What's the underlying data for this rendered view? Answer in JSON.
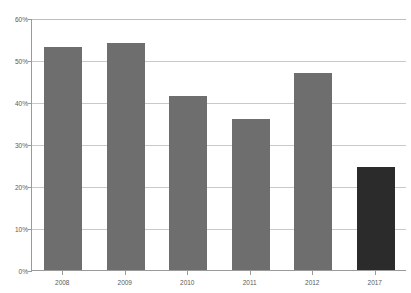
{
  "chart_data": {
    "type": "bar",
    "title": "",
    "xlabel": "",
    "ylabel": "",
    "categories": [
      "2008",
      "2009",
      "2010",
      "2011",
      "2012",
      "2017"
    ],
    "values": [
      53,
      54,
      41.5,
      36,
      47,
      24.5
    ],
    "ylim": [
      0,
      60
    ],
    "ytick_labels": [
      "0%",
      "10%",
      "20%",
      "30%",
      "40%",
      "50%",
      "60%"
    ],
    "ytick_values": [
      0,
      10,
      20,
      30,
      40,
      50,
      60
    ],
    "grid": true,
    "legend": "none",
    "value_suffix": "%",
    "bar_colors": [
      "#6e6e6e",
      "#6e6e6e",
      "#6e6e6e",
      "#6e6e6e",
      "#6e6e6e",
      "#2b2b2b"
    ],
    "highlight_category": "2017",
    "colors": {
      "bar_default": "#6e6e6e",
      "bar_highlight": "#2b2b2b",
      "gridline": "#c9c9c9",
      "axis": "#9a9a9a",
      "tick_text": "#5a5a5a",
      "background": "#ffffff"
    }
  }
}
